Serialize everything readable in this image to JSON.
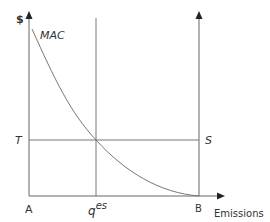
{
  "diagram": {
    "y_axis_label": "$",
    "x_axis_label": "Emissions",
    "curve_label": "MAC",
    "horizontal_line_left_label": "T",
    "horizontal_line_right_label": "S",
    "origin_label": "A",
    "q_label_base": "q",
    "q_label_sup": "es",
    "right_axis_label": "B",
    "colors": {
      "line": "#777777",
      "axis": "#555555",
      "arrow": "#222222",
      "text": "#333333"
    }
  }
}
